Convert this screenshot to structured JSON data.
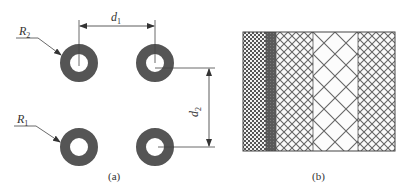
{
  "figure": {
    "panel_a": {
      "caption": "(a)",
      "labels": {
        "R2": {
          "main": "R",
          "sub": "2"
        },
        "R1": {
          "main": "R",
          "sub": "1"
        },
        "d1": {
          "main": "d",
          "sub": "1"
        },
        "d2": {
          "main": "d",
          "sub": "2"
        }
      },
      "rings": [
        {
          "id": "top-left",
          "cx": 79,
          "cy": 63
        },
        {
          "id": "top-right",
          "cx": 155,
          "cy": 63
        },
        {
          "id": "bottom-left",
          "cx": 79,
          "cy": 147
        },
        {
          "id": "bottom-right",
          "cx": 155,
          "cy": 147
        }
      ],
      "ring_outer_radius": 19,
      "ring_inner_radius": 9,
      "ring_color": "#555555"
    },
    "panel_b": {
      "caption": "(b)",
      "layers": [
        {
          "name": "fine-checker",
          "x0": 243,
          "x1": 266
        },
        {
          "name": "dark-band",
          "x0": 266,
          "x1": 276
        },
        {
          "name": "medium-crosshatch",
          "x0": 276,
          "x1": 313
        },
        {
          "name": "large-crosshatch",
          "x0": 313,
          "x1": 358
        },
        {
          "name": "medium-crosshatch",
          "x0": 358,
          "x1": 395
        }
      ]
    }
  }
}
